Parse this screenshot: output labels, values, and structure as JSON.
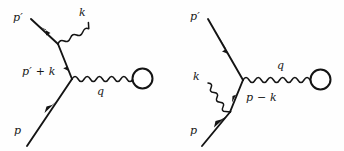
{
  "figure": {
    "type": "feynman-diagram-pair",
    "background_color": "#fefefe",
    "ink_color": "#141414",
    "width": 344,
    "height": 151
  },
  "diagrams": [
    {
      "id": "left-diagram",
      "name": "emission-from-outgoing-leg",
      "labels": {
        "outgoing_fermion": "p′",
        "photon": "k",
        "internal_propagator": "p′ + k",
        "exchanged_boson": "q",
        "incoming_fermion": "p"
      },
      "label_parts": {
        "internal_base": "p",
        "internal_prime": "′",
        "internal_op": "+",
        "internal_second": "k"
      }
    },
    {
      "id": "right-diagram",
      "name": "emission-from-incoming-leg",
      "labels": {
        "outgoing_fermion": "p′",
        "photon": "k",
        "internal_propagator": "p − k",
        "exchanged_boson": "q",
        "incoming_fermion": "p"
      },
      "label_parts": {
        "internal_base": "p",
        "internal_op": "−",
        "internal_second": "k"
      }
    }
  ],
  "legend": {
    "straight_line_meaning": "fermion propagator with momentum arrow",
    "wavy_line_meaning": "photon / boson line",
    "circle_meaning": "interaction blob"
  }
}
